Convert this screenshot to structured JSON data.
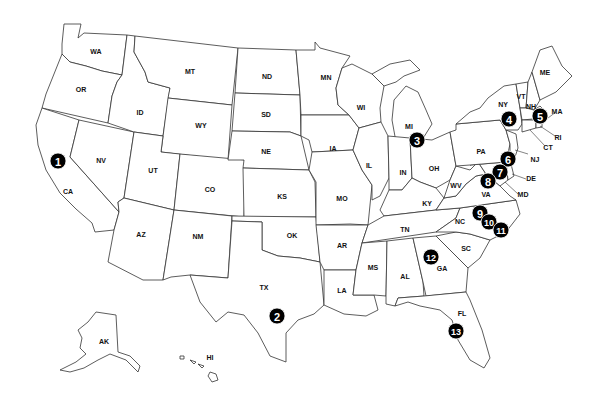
{
  "map": {
    "title": "United States map with numbered locations",
    "colors": {
      "background": "#ffffff",
      "outline": "#333333",
      "marker_fill": "#000000",
      "marker_text": "#ffffff"
    },
    "state_labels": [
      {
        "abbr": "WA",
        "x": 96,
        "y": 52
      },
      {
        "abbr": "OR",
        "x": 81,
        "y": 90
      },
      {
        "abbr": "CA",
        "x": 68,
        "y": 192
      },
      {
        "abbr": "NV",
        "x": 101,
        "y": 161
      },
      {
        "abbr": "ID",
        "x": 140,
        "y": 113
      },
      {
        "abbr": "MT",
        "x": 190,
        "y": 72
      },
      {
        "abbr": "WY",
        "x": 201,
        "y": 126
      },
      {
        "abbr": "UT",
        "x": 153,
        "y": 171
      },
      {
        "abbr": "CO",
        "x": 210,
        "y": 190
      },
      {
        "abbr": "AZ",
        "x": 141,
        "y": 235
      },
      {
        "abbr": "NM",
        "x": 198,
        "y": 237
      },
      {
        "abbr": "ND",
        "x": 267,
        "y": 77
      },
      {
        "abbr": "SD",
        "x": 266,
        "y": 115
      },
      {
        "abbr": "NE",
        "x": 266,
        "y": 152
      },
      {
        "abbr": "KS",
        "x": 282,
        "y": 197
      },
      {
        "abbr": "OK",
        "x": 292,
        "y": 236
      },
      {
        "abbr": "TX",
        "x": 264,
        "y": 288
      },
      {
        "abbr": "MN",
        "x": 326,
        "y": 78
      },
      {
        "abbr": "IA",
        "x": 333,
        "y": 149
      },
      {
        "abbr": "MO",
        "x": 342,
        "y": 199
      },
      {
        "abbr": "AR",
        "x": 342,
        "y": 246
      },
      {
        "abbr": "LA",
        "x": 342,
        "y": 291
      },
      {
        "abbr": "WI",
        "x": 361,
        "y": 108
      },
      {
        "abbr": "IL",
        "x": 369,
        "y": 166
      },
      {
        "abbr": "MS",
        "x": 373,
        "y": 268
      },
      {
        "abbr": "MI",
        "x": 409,
        "y": 127
      },
      {
        "abbr": "IN",
        "x": 403,
        "y": 173
      },
      {
        "abbr": "OH",
        "x": 434,
        "y": 169
      },
      {
        "abbr": "KY",
        "x": 427,
        "y": 204
      },
      {
        "abbr": "TN",
        "x": 405,
        "y": 230
      },
      {
        "abbr": "AL",
        "x": 405,
        "y": 277
      },
      {
        "abbr": "GA",
        "x": 442,
        "y": 269
      },
      {
        "abbr": "FL",
        "x": 462,
        "y": 314
      },
      {
        "abbr": "SC",
        "x": 466,
        "y": 249
      },
      {
        "abbr": "NC",
        "x": 460,
        "y": 222
      },
      {
        "abbr": "VA",
        "x": 486,
        "y": 195
      },
      {
        "abbr": "WV",
        "x": 456,
        "y": 186
      },
      {
        "abbr": "PA",
        "x": 481,
        "y": 152
      },
      {
        "abbr": "NY",
        "x": 503,
        "y": 105
      },
      {
        "abbr": "VT",
        "x": 521,
        "y": 97
      },
      {
        "abbr": "NH",
        "x": 531,
        "y": 107
      },
      {
        "abbr": "ME",
        "x": 545,
        "y": 73
      },
      {
        "abbr": "MA",
        "x": 557,
        "y": 112
      },
      {
        "abbr": "RI",
        "x": 558,
        "y": 138
      },
      {
        "abbr": "CT",
        "x": 548,
        "y": 148
      },
      {
        "abbr": "NJ",
        "x": 535,
        "y": 160
      },
      {
        "abbr": "DE",
        "x": 531,
        "y": 179
      },
      {
        "abbr": "MD",
        "x": 523,
        "y": 195
      },
      {
        "abbr": "AK",
        "x": 104,
        "y": 342
      },
      {
        "abbr": "HI",
        "x": 210,
        "y": 358
      }
    ],
    "markers": [
      {
        "number": "1",
        "x": 58,
        "y": 161,
        "state": "CA"
      },
      {
        "number": "2",
        "x": 277,
        "y": 316,
        "state": "TX"
      },
      {
        "number": "3",
        "x": 417,
        "y": 140,
        "state": "MI"
      },
      {
        "number": "4",
        "x": 509,
        "y": 119,
        "state": "NY"
      },
      {
        "number": "5",
        "x": 540,
        "y": 116,
        "state": "MA"
      },
      {
        "number": "6",
        "x": 508,
        "y": 159,
        "state": "NJ"
      },
      {
        "number": "7",
        "x": 500,
        "y": 172,
        "state": "MD"
      },
      {
        "number": "8",
        "x": 488,
        "y": 181,
        "state": "VA"
      },
      {
        "number": "9",
        "x": 480,
        "y": 213,
        "state": "NC"
      },
      {
        "number": "10",
        "x": 489,
        "y": 222,
        "state": "NC"
      },
      {
        "number": "11",
        "x": 501,
        "y": 230,
        "state": "NC"
      },
      {
        "number": "12",
        "x": 431,
        "y": 257,
        "state": "GA"
      },
      {
        "number": "13",
        "x": 456,
        "y": 331,
        "state": "FL"
      }
    ]
  }
}
